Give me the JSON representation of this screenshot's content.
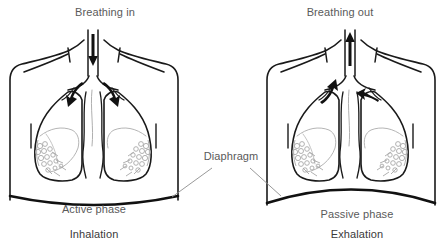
{
  "figure": {
    "title_semantic": "breathing-mechanics-diagram",
    "background_color": "#ffffff",
    "line_color": "#1a1a1a",
    "detail_color": "#9a9a9a",
    "text_color": "#5a5a5a",
    "caption_color": "#3a3a3a",
    "leader_line_color": "#8a8a8a"
  },
  "panels": [
    {
      "id": "inhalation",
      "airflow_label": "Breathing in",
      "airflow_direction": "in",
      "phase_label": "Active phase",
      "caption": "Inhalation",
      "diaphragm_state": "contracted-flattened"
    },
    {
      "id": "exhalation",
      "airflow_label": "Breathing out",
      "airflow_direction": "out",
      "phase_label": "Passive phase",
      "caption": "Exhalation",
      "diaphragm_state": "relaxed-domed"
    }
  ],
  "center_label": {
    "text": "Diaphragm"
  }
}
